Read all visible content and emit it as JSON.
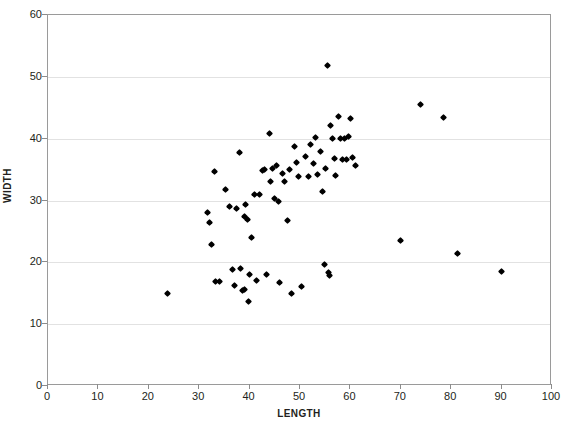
{
  "chart_data": {
    "type": "scatter",
    "title": "",
    "xlabel": "LENGTH",
    "ylabel": "WIDTH",
    "xlim": [
      0,
      100
    ],
    "ylim": [
      0,
      60
    ],
    "xticks": [
      0,
      10,
      20,
      30,
      40,
      50,
      60,
      70,
      80,
      90,
      100
    ],
    "yticks": [
      0,
      10,
      20,
      30,
      40,
      50,
      60
    ],
    "grid": "horizontal",
    "grid_color": "#e2e2e2",
    "marker": "diamond",
    "marker_color": "#000000",
    "legend": null,
    "points": [
      [
        23.8,
        14.9
      ],
      [
        31.6,
        28.1
      ],
      [
        32.0,
        26.5
      ],
      [
        32.4,
        22.9
      ],
      [
        33.0,
        34.7
      ],
      [
        33.2,
        16.9
      ],
      [
        34.0,
        16.9
      ],
      [
        35.2,
        31.7
      ],
      [
        36.0,
        29.0
      ],
      [
        36.6,
        18.9
      ],
      [
        37.0,
        16.2
      ],
      [
        37.4,
        28.7
      ],
      [
        38.0,
        37.8
      ],
      [
        38.2,
        19.0
      ],
      [
        38.6,
        15.5
      ],
      [
        38.9,
        15.6
      ],
      [
        39.0,
        27.4
      ],
      [
        39.2,
        29.3
      ],
      [
        39.6,
        27.0
      ],
      [
        39.8,
        13.7
      ],
      [
        40.0,
        18.1
      ],
      [
        40.4,
        24.0
      ],
      [
        41.0,
        31.0
      ],
      [
        41.4,
        17.0
      ],
      [
        42.0,
        30.9
      ],
      [
        42.6,
        34.8
      ],
      [
        43.0,
        35.0
      ],
      [
        43.4,
        18.0
      ],
      [
        44.0,
        40.8
      ],
      [
        44.2,
        33.0
      ],
      [
        44.6,
        35.2
      ],
      [
        45.0,
        30.4
      ],
      [
        45.4,
        35.6
      ],
      [
        45.8,
        29.9
      ],
      [
        46.0,
        16.8
      ],
      [
        46.6,
        34.3
      ],
      [
        47.0,
        33.0
      ],
      [
        47.6,
        26.7
      ],
      [
        48.0,
        35.0
      ],
      [
        48.4,
        15.0
      ],
      [
        49.0,
        38.8
      ],
      [
        49.4,
        36.1
      ],
      [
        49.8,
        33.9
      ],
      [
        50.2,
        16.1
      ],
      [
        51.0,
        37.1
      ],
      [
        51.6,
        33.9
      ],
      [
        52.0,
        39.1
      ],
      [
        52.6,
        36.0
      ],
      [
        53.0,
        40.2
      ],
      [
        53.4,
        34.2
      ],
      [
        54.0,
        37.9
      ],
      [
        54.4,
        31.4
      ],
      [
        54.8,
        19.6
      ],
      [
        55.0,
        35.1
      ],
      [
        55.4,
        51.8
      ],
      [
        55.6,
        18.3
      ],
      [
        55.8,
        17.8
      ],
      [
        56.0,
        42.1
      ],
      [
        56.4,
        40.0
      ],
      [
        56.8,
        36.8
      ],
      [
        57.0,
        34.0
      ],
      [
        57.6,
        43.6
      ],
      [
        58.0,
        40.0
      ],
      [
        58.4,
        36.7
      ],
      [
        58.8,
        40.1
      ],
      [
        59.2,
        36.7
      ],
      [
        59.6,
        40.4
      ],
      [
        60.0,
        43.3
      ],
      [
        60.4,
        36.9
      ],
      [
        61.0,
        35.6
      ],
      [
        70.0,
        23.6
      ],
      [
        74.0,
        45.6
      ],
      [
        78.5,
        43.5
      ],
      [
        81.2,
        21.5
      ],
      [
        90.0,
        18.5
      ]
    ]
  }
}
